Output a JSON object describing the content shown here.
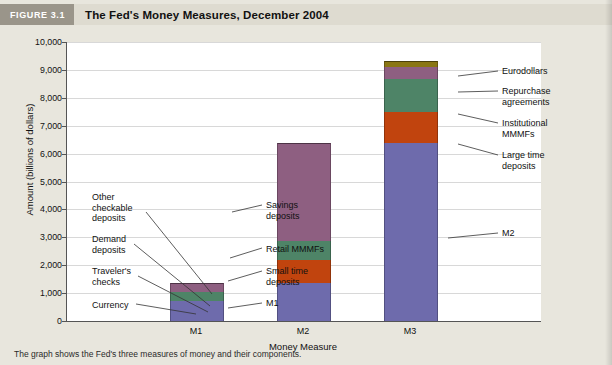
{
  "figure": {
    "tag": "FIGURE 3.1",
    "title": "The Fed's Money Measures, December 2004",
    "caption": "The graph shows the Fed's three measures of money and their components."
  },
  "colors": {
    "currency": "#6E6BAC",
    "travelers_checks": "#C1440E",
    "demand_deposits": "#4E8467",
    "other_checkable": "#8E5F81",
    "m1_base": "#6E6BAC",
    "small_time": "#C1440E",
    "retail_mmmf": "#4E8467",
    "savings": "#8E5F81",
    "m2_base": "#6E6BAC",
    "large_time": "#C1440E",
    "institutional_mmmf": "#4E8467",
    "repurchase": "#8E5F81",
    "eurodollars": "#8A7614",
    "tag_background": "#9a958a",
    "header_background": "#dedbd0",
    "page_background": "#e8e6dd",
    "plot_background": "#ffffff",
    "gridline": "#d8d8d8"
  },
  "chart_data": {
    "type": "bar",
    "title": "The Fed's Money Measures, December 2004",
    "xlabel": "Money Measure",
    "ylabel": "Amount (billions of dollars)",
    "categories": [
      "M1",
      "M2",
      "M3"
    ],
    "ylim": [
      0,
      10000
    ],
    "yticks": [
      "0",
      "1,000",
      "2,000",
      "3,000",
      "4,000",
      "5,000",
      "6,000",
      "7,000",
      "8,000",
      "9,000",
      "10,000"
    ],
    "ytick_values": [
      0,
      1000,
      2000,
      3000,
      4000,
      5000,
      6000,
      7000,
      8000,
      9000,
      10000
    ],
    "grid": true,
    "legend": "none",
    "stacked": true,
    "bars": [
      {
        "category": "M1",
        "total": 1355,
        "segments": [
          {
            "name": "Currency",
            "value": 700,
            "color": "#6E6BAC"
          },
          {
            "name": "Traveler's checks",
            "value": 8,
            "color": "#C1440E"
          },
          {
            "name": "Demand deposits",
            "value": 315,
            "color": "#4E8467"
          },
          {
            "name": "Other checkable deposits",
            "value": 332,
            "color": "#8E5F81"
          }
        ]
      },
      {
        "category": "M2",
        "total": 6395,
        "segments": [
          {
            "name": "M1",
            "value": 1355,
            "color": "#6E6BAC"
          },
          {
            "name": "Small time deposits",
            "value": 820,
            "color": "#C1440E"
          },
          {
            "name": "Retail MMMFs",
            "value": 700,
            "color": "#4E8467"
          },
          {
            "name": "Savings deposits",
            "value": 3520,
            "color": "#8E5F81"
          }
        ]
      },
      {
        "category": "M3",
        "total": 9330,
        "segments": [
          {
            "name": "M2",
            "value": 6395,
            "color": "#6E6BAC"
          },
          {
            "name": "Large time deposits",
            "value": 1090,
            "color": "#C1440E"
          },
          {
            "name": "Institutional MMMFs",
            "value": 1195,
            "color": "#4E8467"
          },
          {
            "name": "Repurchase agreements",
            "value": 420,
            "color": "#8E5F81"
          },
          {
            "name": "Eurodollars",
            "value": 230,
            "color": "#8A7614"
          }
        ]
      }
    ],
    "annotations": {
      "left": [
        {
          "id": "other-checkable-deposits",
          "line1": "Other",
          "line2": "checkable",
          "line3": "deposits"
        },
        {
          "id": "demand-deposits",
          "line1": "Demand",
          "line2": "deposits"
        },
        {
          "id": "travelers-checks",
          "line1": "Traveler's",
          "line2": "checks"
        },
        {
          "id": "currency",
          "line1": "Currency"
        }
      ],
      "center": [
        {
          "id": "savings-deposits",
          "line1": "Savings",
          "line2": "deposits"
        },
        {
          "id": "retail-mmmfs",
          "line1": "Retail MMMFs"
        },
        {
          "id": "small-time-deposits",
          "line1": "Small time",
          "line2": "deposits"
        },
        {
          "id": "m1",
          "line1": "M1"
        }
      ],
      "right": [
        {
          "id": "eurodollars",
          "line1": "Eurodollars"
        },
        {
          "id": "repurchase-agreements",
          "line1": "Repurchase",
          "line2": "agreements"
        },
        {
          "id": "institutional-mmmfs",
          "line1": "Institutional",
          "line2": "MMMFs"
        },
        {
          "id": "large-time-deposits",
          "line1": "Large time",
          "line2": "deposits"
        },
        {
          "id": "m2",
          "line1": "M2"
        }
      ]
    }
  }
}
